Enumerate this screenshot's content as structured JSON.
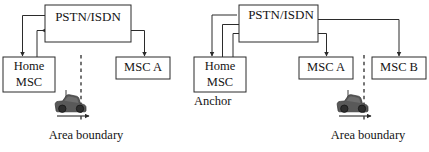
{
  "figure": {
    "stroke_color": "#2b2b2b",
    "text_color": "#141414",
    "car_color": "#595959",
    "background": "#ffffff"
  },
  "panels": [
    {
      "id": "left",
      "nodes": {
        "pstn": {
          "label": "PSTN/ISDN"
        },
        "home_msc": {
          "label_line1": "Home",
          "label_line2": "MSC"
        },
        "msc_a": {
          "label": "MSC A"
        }
      },
      "boundary_caption": "Area boundary",
      "anchor_caption": "",
      "links": [
        {
          "name": "pstn-to-home-msc",
          "style": "solid",
          "from": "pstn",
          "to": "home_msc",
          "arrow": "down"
        },
        {
          "name": "home-msc-to-pstn",
          "style": "dashed",
          "from": "home_msc",
          "to": "pstn",
          "arrow": "left"
        },
        {
          "name": "pstn-to-msc-a",
          "style": "solid",
          "from": "pstn",
          "to": "msc_a",
          "arrow": "down"
        }
      ]
    },
    {
      "id": "right",
      "nodes": {
        "pstn": {
          "label": "PSTN/ISDN"
        },
        "home_msc": {
          "label_line1": "Home",
          "label_line2": "MSC"
        },
        "msc_a": {
          "label": "MSC A"
        },
        "msc_b": {
          "label": "MSC B"
        }
      },
      "boundary_caption": "Area boundary",
      "anchor_caption": "Anchor",
      "links": [
        {
          "name": "pstn-to-home-msc",
          "style": "solid",
          "from": "pstn",
          "to": "home_msc",
          "arrow": "down"
        },
        {
          "name": "home-msc-to-pstn-solid",
          "style": "solid",
          "from": "home_msc",
          "to": "pstn",
          "arrow": "right"
        },
        {
          "name": "home-msc-to-pstn-dashed",
          "style": "dashed",
          "from": "home_msc",
          "to": "pstn",
          "arrow": "right"
        },
        {
          "name": "pstn-to-msc-a",
          "style": "solid",
          "from": "pstn",
          "to": "msc_a",
          "arrow": "down"
        },
        {
          "name": "pstn-to-msc-b",
          "style": "solid",
          "from": "pstn",
          "to": "msc_b",
          "arrow": "down"
        }
      ]
    }
  ]
}
